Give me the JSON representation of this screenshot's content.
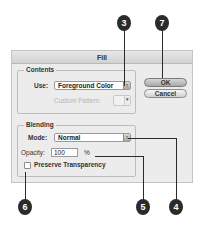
{
  "dialog": {
    "title": "Fill",
    "contents": {
      "group_label": "Contents",
      "use_label": "Use:",
      "use_value": "Foreground Color",
      "custom_pattern_label": "Custom Pattern:"
    },
    "blending": {
      "group_label": "Blending",
      "mode_label": "Mode:",
      "mode_value": "Normal",
      "opacity_label": "Opacity:",
      "opacity_value": "100",
      "opacity_unit": "%",
      "preserve_transparency_label": "Preserve Transparency",
      "preserve_transparency_checked": false
    },
    "buttons": {
      "ok_label": "OK",
      "cancel_label": "Cancel"
    }
  },
  "callouts": {
    "use": "3",
    "ok": "7",
    "preserve": "6",
    "opacity": "5",
    "mode": "4"
  },
  "icons": {
    "select_arrows": "updown-arrows-icon",
    "pattern_arrow": "chevron-down-icon"
  },
  "colors": {
    "callout_bg": "#2b2b2b",
    "dialog_bg": "#ececec"
  }
}
